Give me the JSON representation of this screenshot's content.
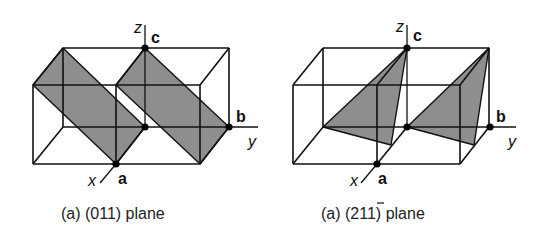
{
  "figures": [
    {
      "id": "left",
      "caption": "(a) (011) plane",
      "plane_fill": "#8e8e8e",
      "axes": {
        "x": "x",
        "y": "y",
        "z": "z"
      },
      "points": {
        "a": "a",
        "b": "b",
        "c": "c"
      }
    },
    {
      "id": "right",
      "caption_prefix": "(a) (2",
      "caption_bar_digit": "1",
      "caption_suffix": "1) plane",
      "caption_full": "(a) (2̅1) plane",
      "plane_fill": "#8e8e8e",
      "axes": {
        "x": "x",
        "y": "y",
        "z": "z"
      },
      "points": {
        "a": "a",
        "b": "b",
        "c": "c"
      }
    }
  ],
  "colors": {
    "line": "#111111",
    "plane": "#8e8e8e",
    "background": "#ffffff"
  }
}
